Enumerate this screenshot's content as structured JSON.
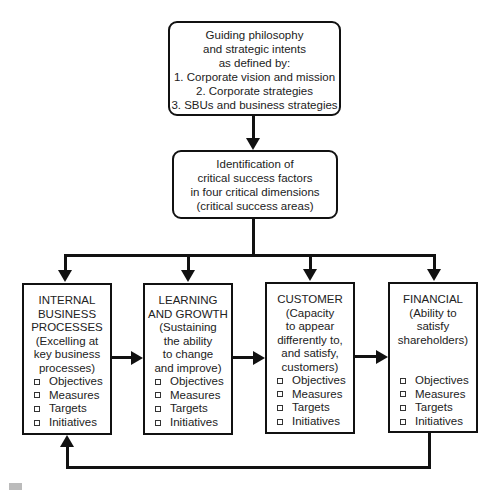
{
  "top_box": {
    "lines": [
      "Guiding philosophy",
      "and strategic intents",
      "as defined by:",
      "1.  Corporate vision and mission",
      "2.  Corporate strategies",
      "3. SBUs and business strategies"
    ]
  },
  "middle_box": {
    "lines": [
      "Identification of",
      "critical success factors",
      "in four critical dimensions",
      "(critical success areas)"
    ]
  },
  "dimensions": [
    {
      "title_lines": [
        "INTERNAL",
        "BUSINESS",
        "PROCESSES",
        "(Excelling at",
        "key business",
        "processes)"
      ],
      "bullets": [
        "Objectives",
        "Measures",
        "Targets",
        "Initiatives"
      ]
    },
    {
      "title_lines": [
        "LEARNING",
        "AND GROWTH",
        "(Sustaining",
        "the ability",
        "to change",
        "and improve)"
      ],
      "bullets": [
        "Objectives",
        "Measures",
        "Targets",
        "Initiatives"
      ]
    },
    {
      "title_lines": [
        "CUSTOMER",
        "(Capacity",
        "to appear",
        "differently to,",
        "and satisfy,",
        "customers)"
      ],
      "bullets": [
        "Objectives",
        "Measures",
        "Targets",
        "Initiatives"
      ]
    },
    {
      "title_lines": [
        "FINANCIAL",
        "(Ability to",
        "satisfy",
        "shareholders)"
      ],
      "bullets": [
        "Objectives",
        "Measures",
        "Targets",
        "Initiatives"
      ]
    }
  ],
  "colors": {
    "line": "#111111",
    "text": "#222222",
    "background": "#ffffff"
  }
}
